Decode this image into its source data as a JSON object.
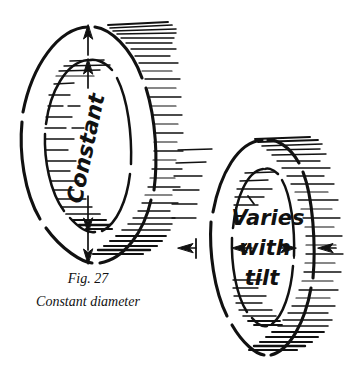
{
  "figure": {
    "background_color": "#ffffff",
    "ink_color": "#111111",
    "caption": {
      "number_label": "Fig. 27",
      "title": "Constant diameter"
    },
    "left_ring": {
      "name": "constant-diameter-ring",
      "annotation": "Constant",
      "annotation_orientation": "vertical",
      "dimension": "vertical-double-arrow",
      "arrow_top_outer": "up",
      "arrow_top_inner": "up",
      "arrow_bottom_inner": "down",
      "arrow_bottom_outer": "down",
      "outer_center_x": 88,
      "outer_center_y": 145,
      "outer_rx": 66,
      "outer_ry": 118,
      "inner_rx": 42,
      "inner_ry": 86
    },
    "right_ring": {
      "name": "varies-with-tilt-ring",
      "annotation_lines": [
        "Varies",
        "with",
        "tilt"
      ],
      "dimension": "horizontal-double-arrow",
      "arrow_inner_left": "left",
      "arrow_inner_right": "right",
      "arrow_outer_left": "left",
      "arrow_outer_right": "right",
      "outer_center_x": 263,
      "outer_center_y": 248,
      "outer_rx": 52,
      "outer_ry": 108,
      "inner_rx": 31,
      "inner_ry": 80
    },
    "hatching": {
      "style": "horizontal-line-shading",
      "left_ring_exterior_side": "right",
      "right_ring_exterior_side": "right",
      "interior_dashes": true
    }
  }
}
